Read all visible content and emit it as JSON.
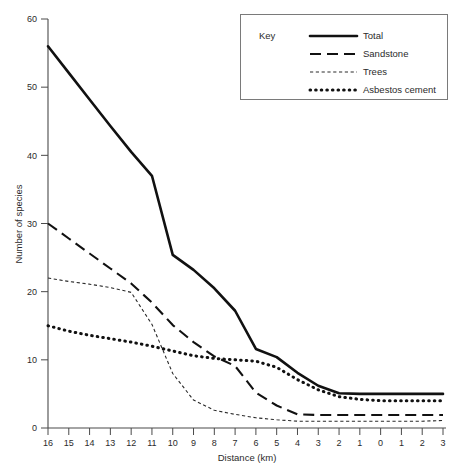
{
  "chart_data": {
    "type": "line",
    "title": "",
    "xlabel": "Distance (km)",
    "ylabel": "Number of species",
    "xticklabels": [
      "16",
      "15",
      "14",
      "13",
      "12",
      "11",
      "10",
      "9",
      "8",
      "7",
      "6",
      "5",
      "4",
      "3",
      "2",
      "1",
      "0",
      "1",
      "2",
      "3"
    ],
    "x": [
      16,
      15,
      14,
      13,
      12,
      11,
      10,
      9,
      8,
      7,
      6,
      5,
      4,
      3,
      2,
      1,
      0,
      -1,
      -2,
      -3
    ],
    "yticklabels": [
      "0",
      "10",
      "20",
      "30",
      "40",
      "50",
      "60"
    ],
    "yticks": [
      0,
      10,
      20,
      30,
      40,
      50,
      60
    ],
    "ylim": [
      0,
      60
    ],
    "grid": false,
    "legend_position": "top-right",
    "legend_title": "Key",
    "series": [
      {
        "name": "Total",
        "style": "solid",
        "values": [
          56,
          52.1,
          48.2,
          44.3,
          40.5,
          37,
          25.4,
          23.2,
          20.5,
          17.2,
          11.6,
          10.4,
          8.1,
          6.2,
          5.1,
          5.0,
          5.0,
          5.0,
          5.0,
          5.0
        ]
      },
      {
        "name": "Sandstone",
        "style": "long-dash",
        "values": [
          30,
          27.8,
          25.6,
          23.4,
          21.2,
          18.4,
          15.1,
          12.6,
          10.5,
          9.1,
          5.2,
          3.3,
          2.0,
          1.9,
          1.9,
          1.9,
          1.9,
          1.9,
          1.9,
          1.9
        ]
      },
      {
        "name": "Trees",
        "style": "short-dash",
        "values": [
          22,
          21.5,
          21.1,
          20.6,
          19.9,
          15.2,
          8.0,
          4.1,
          2.6,
          2.0,
          1.5,
          1.2,
          1.0,
          1.0,
          1.0,
          1.0,
          1.0,
          1.0,
          1.0,
          1.1
        ]
      },
      {
        "name": "Asbestos cement",
        "style": "dotted",
        "values": [
          15,
          14.2,
          13.6,
          13.1,
          12.6,
          12.0,
          11.3,
          10.6,
          10.2,
          10.0,
          9.8,
          8.9,
          7.1,
          5.6,
          4.6,
          4.2,
          4.0,
          4.0,
          4.0,
          4.0
        ]
      }
    ]
  },
  "legend": {
    "title": "Key",
    "entries": [
      {
        "label": "Total",
        "style": "solid"
      },
      {
        "label": "Sandstone",
        "style": "long-dash"
      },
      {
        "label": "Trees",
        "style": "short-dash"
      },
      {
        "label": "Asbestos cement",
        "style": "dotted"
      }
    ]
  },
  "axes": {
    "x_title": "Distance (km)",
    "y_title": "Number of species"
  }
}
